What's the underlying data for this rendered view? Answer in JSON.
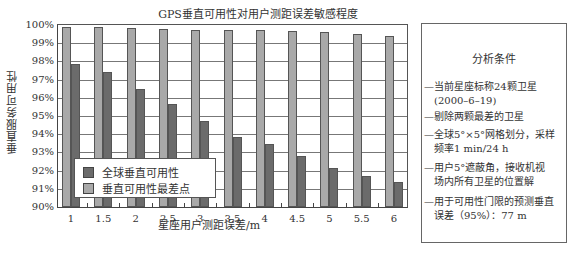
{
  "chart_data": {
    "type": "bar",
    "title": "GPS垂直可用性对用户测距误差敏感程度",
    "xlabel": "星座用户测距误差/m",
    "ylabel": "垂直服务可用性",
    "categories": [
      "1",
      "1.5",
      "2",
      "2.5",
      "3",
      "3.5",
      "4",
      "4.5",
      "5",
      "5.5",
      "6"
    ],
    "series": [
      {
        "name": "垂直可用性最差点",
        "color": "#a9a9a9",
        "values": [
          99.9,
          99.9,
          99.85,
          99.8,
          99.75,
          99.7,
          99.7,
          99.65,
          99.6,
          99.5,
          99.4
        ]
      },
      {
        "name": "全球垂直可用性",
        "color": "#6b6b6b",
        "values": [
          97.85,
          97.4,
          96.5,
          95.65,
          94.7,
          93.85,
          93.45,
          92.8,
          92.15,
          91.7,
          91.4
        ]
      }
    ],
    "ylim": [
      90,
      100
    ],
    "yticks": [
      "90%",
      "91%",
      "92%",
      "93%",
      "94%",
      "95%",
      "96%",
      "97%",
      "98%",
      "99%",
      "100%"
    ],
    "grid": true,
    "legend_position": "lower-left inside"
  },
  "legend": {
    "items": [
      {
        "label": "全球垂直可用性",
        "color": "#6b6b6b"
      },
      {
        "label": "垂直可用性最差点",
        "color": "#a9a9a9"
      }
    ]
  },
  "info_box": {
    "title": "分析条件",
    "items": [
      {
        "line1": "—当前星座标称24颗卫星",
        "line2": "(2000–6–19)"
      },
      {
        "line1": "—剔除两颗最差的卫星",
        "line2": ""
      },
      {
        "line1": "—全球5°×5°网格划分，采样",
        "line2": "频率1 min/24 h"
      },
      {
        "line1": "—用户5°遮蔽角，接收机视",
        "line2": "场内所有卫星的位置解"
      },
      {
        "line1": "—用于可用性门限的预测垂直",
        "line2": "误差（95%）：77 m"
      }
    ]
  }
}
